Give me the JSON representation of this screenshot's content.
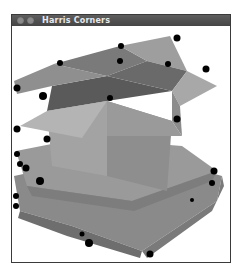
{
  "window": {
    "title": "Harris Corners",
    "buttons": [
      "close",
      "minimize"
    ]
  },
  "image": {
    "subject": "open cardboard boxes stacked",
    "corner_marker_color": "#000000",
    "corner_count": 30
  }
}
